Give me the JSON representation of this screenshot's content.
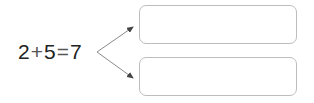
{
  "equation": {
    "operand1": "2",
    "op_plus": "+",
    "operand2": "5",
    "op_equals": "=",
    "result": "7"
  },
  "answer_boxes": [
    {
      "value": ""
    },
    {
      "value": ""
    }
  ],
  "colors": {
    "text": "#222222",
    "arrow": "#8a8a8a",
    "box_border": "#bdbdbd"
  }
}
